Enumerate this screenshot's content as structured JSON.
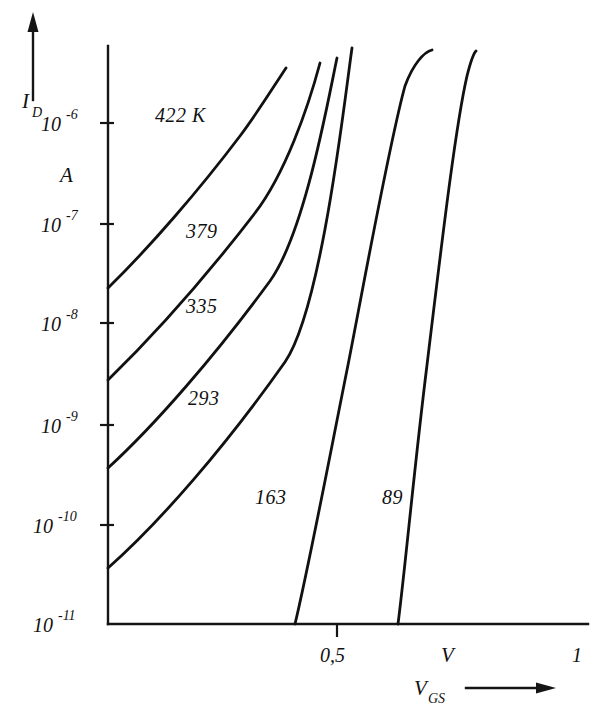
{
  "chart_data": {
    "type": "line",
    "title": "",
    "xlabel": "V_GS",
    "ylabel": "I_D",
    "x_unit": "V",
    "y_unit": "A",
    "x_axis": {
      "label": "V",
      "label_sub": "GS",
      "unit": "V",
      "ticks": [
        {
          "value": 0.5,
          "label": "0,5",
          "px": 337
        },
        {
          "value": 1.0,
          "label": "1",
          "px": 578
        }
      ],
      "range": [
        0.04,
        1.04
      ],
      "arrow": true
    },
    "y_axis": {
      "label": "I",
      "label_sub": "D",
      "unit": "A",
      "ticks": [
        {
          "value": 1e-06,
          "mantissa": "10",
          "exponent": "-6",
          "label": "10^-6"
        },
        {
          "value": 1e-07,
          "mantissa": "10",
          "exponent": "-7",
          "label": "10^-7"
        },
        {
          "value": 1e-08,
          "mantissa": "10",
          "exponent": "-8",
          "label": "10^-8"
        },
        {
          "value": 1e-09,
          "mantissa": "10",
          "exponent": "-9",
          "label": "10^-9"
        },
        {
          "value": 1e-10,
          "mantissa": "10",
          "exponent": "-10",
          "label": "10^-10"
        },
        {
          "value": 1e-11,
          "mantissa": "10",
          "exponent": "-11",
          "label": "10^-11"
        }
      ],
      "scale": "log",
      "range": [
        1e-11,
        3e-06
      ],
      "arrow": true
    },
    "grid": false,
    "legend_position": "inline-annotations",
    "series": [
      {
        "name": "422 K",
        "label": "422 K",
        "temperature_k": 422,
        "label_pos": {
          "x": 155,
          "y": 122
        },
        "path": "M 108,288 C 150,247 200,189 240,136 C 258,112 274,86 286,68",
        "points": [
          [
            0.04,
            2.5e-08
          ],
          [
            0.13,
            4e-07
          ],
          [
            0.22,
            2.2e-06
          ],
          [
            0.28,
            4.5e-06
          ]
        ]
      },
      {
        "name": "379",
        "label": "379",
        "temperature_k": 379,
        "label_pos": {
          "x": 186,
          "y": 238
        },
        "path": "M 108,380 C 150,339 205,278 255,213 C 285,174 308,108 320,63",
        "points": [
          [
            0.04,
            2.6e-09
          ],
          [
            0.15,
            1.3e-07
          ],
          [
            0.26,
            3.3e-06
          ],
          [
            0.33,
            5e-06
          ]
        ]
      },
      {
        "name": "335",
        "label": "335",
        "temperature_k": 335,
        "label_pos": {
          "x": 186,
          "y": 313
        },
        "path": "M 108,468 C 155,425 215,356 270,281 C 305,232 328,100 337,58",
        "points": [
          [
            0.04,
            3.4e-10
          ],
          [
            0.17,
            3.5e-08
          ],
          [
            0.29,
            2.4e-06
          ],
          [
            0.36,
            5.5e-06
          ]
        ]
      },
      {
        "name": "293",
        "label": "293",
        "temperature_k": 293,
        "label_pos": {
          "x": 188,
          "y": 405
        },
        "path": "M 108,568 C 160,522 225,447 285,362 C 322,308 345,96 352,48",
        "points": [
          [
            0.04,
            3.6e-11
          ],
          [
            0.19,
            7.5e-09
          ],
          [
            0.32,
            1.6e-06
          ],
          [
            0.39,
            7e-06
          ]
        ]
      },
      {
        "name": "163",
        "label": "163",
        "temperature_k": 163,
        "label_pos": {
          "x": 255,
          "y": 504
        },
        "path": "M 295,624 C 308,570 327,470 348,365 C 368,262 390,140 405,86 C 413,64 424,52 432,50",
        "points": [
          [
            0.405,
            1e-11
          ],
          [
            0.47,
            5e-09
          ],
          [
            0.55,
            3e-07
          ],
          [
            0.6,
            4e-06
          ]
        ]
      },
      {
        "name": "89",
        "label": "89",
        "temperature_k": 89,
        "label_pos": {
          "x": 382,
          "y": 504
        },
        "path": "M 398,624 C 405,570 414,470 427,365 C 440,258 455,128 467,76 C 471,60 474,53 476,51",
        "points": [
          [
            0.615,
            1e-11
          ],
          [
            0.67,
            5e-09
          ],
          [
            0.73,
            3e-07
          ],
          [
            0.79,
            4.5e-06
          ]
        ]
      }
    ]
  },
  "annotations": {
    "y_axis_unit": "A",
    "x_axis_unit": "V",
    "x_right_tick_label": "1",
    "x_mid_tick_label": "0,5"
  }
}
